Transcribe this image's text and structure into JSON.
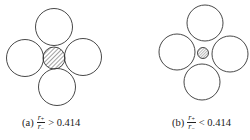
{
  "figures": [
    {
      "id": "a",
      "label": "(a)",
      "numerator": "r",
      "numerator_sub": "+",
      "denominator": "r",
      "denominator_sub": "−",
      "relation": "> 0.414",
      "center_ion": "hatched, large (touches anions)"
    },
    {
      "id": "b",
      "label": "(b)",
      "numerator": "r",
      "numerator_sub": "+",
      "denominator": "r",
      "denominator_sub": "−",
      "relation": "< 0.414",
      "center_ion": "hatched, small (rattles in hole)"
    }
  ],
  "colors": {
    "stroke": "#333333",
    "hatch": "#444444",
    "background": "#ffffff"
  }
}
